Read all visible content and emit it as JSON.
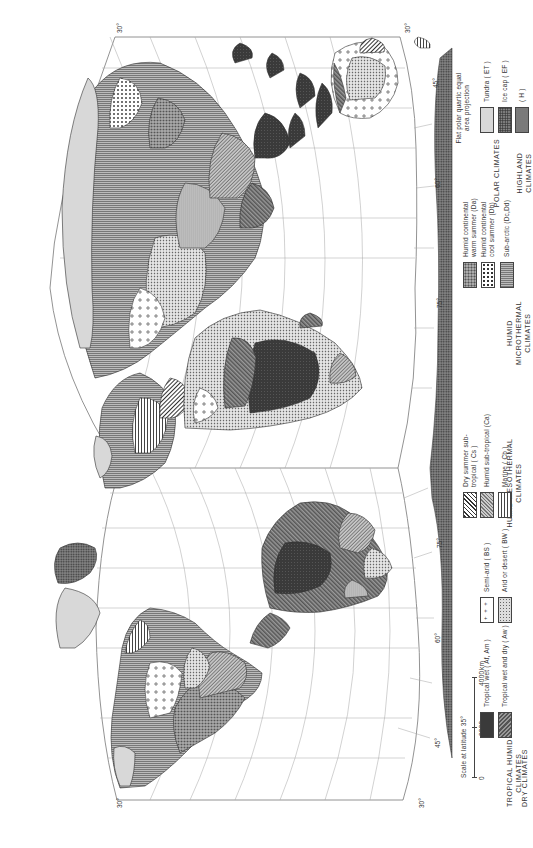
{
  "map": {
    "projection_note": "Flat polar quartic equal area projection",
    "scale": {
      "title": "Scale at latitude 35°",
      "ticks": [
        "0",
        "2000",
        "4000"
      ],
      "unit": "km"
    },
    "graticule": {
      "latitude_labels_top": [
        "30°",
        "15°",
        "0°",
        "15°",
        "30°"
      ],
      "latitude_labels_bottom": [
        "30°",
        "15°",
        "0°",
        "15°",
        "30°"
      ],
      "latitude_labels_left_side": [
        "45°",
        "60°",
        "75°"
      ],
      "latitude_labels_right_side": [
        "45°",
        "60°",
        "75°"
      ],
      "antarctic_longitude_labels": [
        "90°",
        "180°",
        "150°",
        "120°",
        "90°",
        "60°",
        "30°",
        "0°",
        "30°",
        "60°",
        "90°",
        "120°",
        "150°",
        "180°",
        "90°"
      ],
      "arctic_longitude_labels": [
        "180°",
        "90°",
        "150°",
        "120°",
        "90°",
        "60°",
        "30°",
        "0°",
        "30°",
        "60°",
        "90°",
        "120°",
        "150°",
        "180°",
        "90°"
      ]
    }
  },
  "legend": {
    "groups": [
      {
        "name": "TROPICAL HUMID CLIMATES",
        "items": [
          {
            "label": "Tropical wet ( Af, Am )",
            "pattern": "af"
          },
          {
            "label": "Tropical wet and dry ( Aw )",
            "pattern": "aw"
          }
        ]
      },
      {
        "name": "DRY CLIMATES",
        "items": [
          {
            "label": "Semi-arid ( BS )",
            "pattern": "bs"
          },
          {
            "label": "Arid or desert ( BW )",
            "pattern": "bw"
          }
        ]
      },
      {
        "name": "HUMID MESOTHERMAL CLIMATES",
        "items": [
          {
            "label": "Dry summer sub-tropical ( Cs )",
            "pattern": "cs"
          },
          {
            "label": "Humid sub-tropical (Ca)",
            "pattern": "ca"
          },
          {
            "label": "Marine ( Cb )",
            "pattern": "cb"
          }
        ]
      },
      {
        "name": "HUMID MICROTHERMAL CLIMATES",
        "items": [
          {
            "label": "Humid continental warm summer (Da)",
            "pattern": "da"
          },
          {
            "label": "Humid continental cool summer (Db)",
            "pattern": "db"
          },
          {
            "label": "Sub-arctic (Dc,Dd)",
            "pattern": "dc"
          }
        ]
      },
      {
        "name": "POLAR CLIMATES",
        "items": [
          {
            "label": "Tundra ( ET )",
            "pattern": "et"
          },
          {
            "label": "Ice cap ( EF )",
            "pattern": "ef"
          }
        ]
      },
      {
        "name": "HIGHLAND CLIMATES",
        "items": [
          {
            "label": "( H )",
            "pattern": "h"
          }
        ]
      }
    ]
  },
  "colors": {
    "ink": "#2a2a2a",
    "grid": "#9a9a9a",
    "paper": "#ffffff"
  }
}
